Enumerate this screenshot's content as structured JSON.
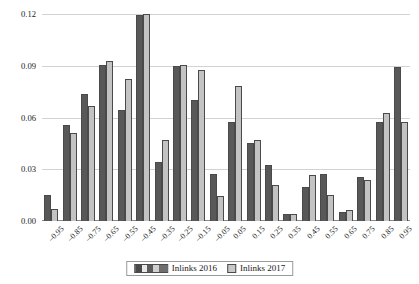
{
  "chart_data": {
    "type": "bar",
    "title": "",
    "subtitle": "",
    "xlabel": "",
    "ylabel": "",
    "ylim": [
      0.0,
      0.12
    ],
    "yticks": [
      "0.00",
      "0.03",
      "0.06",
      "0.09",
      "0.12"
    ],
    "ytick_values": [
      0.0,
      0.03,
      0.06,
      0.09,
      0.12
    ],
    "grid": true,
    "legend_position": "bottom-center",
    "categories": [
      "–0.95",
      "–0.85",
      "–0.75",
      "–0.65",
      "–0.55",
      "–0.45",
      "–0.35",
      "–0.25",
      "–0.15",
      "–0.05",
      "0.05",
      "0.15",
      "0.25",
      "0.35",
      "0.45",
      "0.55",
      "0.65",
      "0.75",
      "0.85",
      "0.95"
    ],
    "series": [
      {
        "name": "Inlinks 2016",
        "color": "#585858",
        "values": [
          0.015,
          0.0555,
          0.0735,
          0.0905,
          0.0645,
          0.1195,
          0.034,
          0.09,
          0.07,
          0.027,
          0.0575,
          0.045,
          0.0325,
          0.004,
          0.02,
          0.0275,
          0.005,
          0.0255,
          0.0575,
          0.0895
        ]
      },
      {
        "name": "Inlinks 2017",
        "color": "#c3c3c3",
        "values": [
          0.007,
          0.051,
          0.0665,
          0.0925,
          0.0825,
          0.12,
          0.047,
          0.0905,
          0.0875,
          0.0145,
          0.078,
          0.047,
          0.021,
          0.004,
          0.0265,
          0.015,
          0.0065,
          0.0235,
          0.0625,
          0.0575
        ]
      }
    ]
  },
  "legend": {
    "items": [
      {
        "label": "Inlinks 2016",
        "swatch": "series-2016-swatch"
      },
      {
        "label": "Inlinks 2017",
        "swatch": "series-2017-swatch"
      }
    ]
  }
}
